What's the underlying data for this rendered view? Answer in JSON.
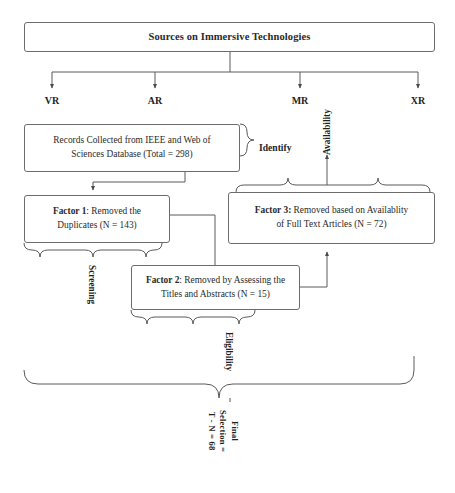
{
  "diagram": {
    "type": "flowchart",
    "kind": "prisma-style-literature-selection",
    "title_box": {
      "label": "Sources on Immersive Technologies"
    },
    "branches": [
      {
        "label": "VR",
        "x": 52
      },
      {
        "label": "AR",
        "x": 155
      },
      {
        "label": "MR",
        "x": 300
      },
      {
        "label": "XR",
        "x": 418
      }
    ],
    "boxes": {
      "records": {
        "line1": "Records Collected from IEEE and Web of",
        "line2": "Sciences Database (Total = 298)"
      },
      "factor1": {
        "bold": "Factor 1",
        "line1": ": Removed the",
        "line2": "Duplicates (N = 143)"
      },
      "factor2": {
        "bold": "Factor 2",
        "line1": ": Removed by Assessing the",
        "line2": "Titles and Abstracts (N = 15)"
      },
      "factor3": {
        "bold": "Factor 3:",
        "line1": " Removed based on Availablity",
        "line2": "of Full Text Articles (N = 72)"
      }
    },
    "stage_labels": {
      "identify": "Identify",
      "availability": "Availability",
      "screening": "Screening",
      "eligibility": "Eligibility",
      "final_selection_line1": "Final",
      "final_selection_line2": "Selection =",
      "final_selection_line3": "T - N = 68"
    },
    "colors": {
      "stroke": "#6c6c6c",
      "wire": "#555555",
      "text": "#2a2a2a",
      "background": "#ffffff"
    }
  }
}
